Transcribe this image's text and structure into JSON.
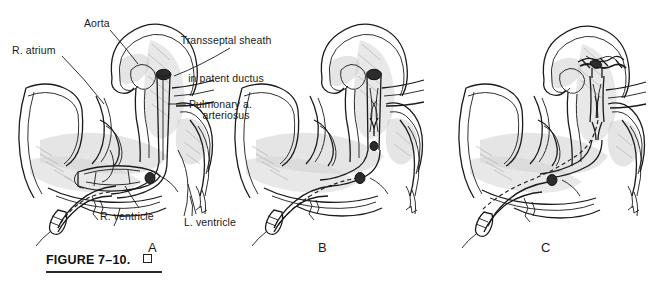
{
  "figure": {
    "caption_text": "FIGURE 7–10.",
    "caption_box_icon": "open-square-icon",
    "panels": [
      {
        "letter": "A",
        "x": 148,
        "y": 240
      },
      {
        "letter": "B",
        "x": 318,
        "y": 240
      },
      {
        "letter": "C",
        "x": 541,
        "y": 240
      }
    ]
  },
  "labels": {
    "r_atrium": "R. atrium",
    "aorta": "Aorta",
    "transseptal_sheath": "Transseptal sheath\nin patent ductus\narteriosus",
    "transseptal_sheath_line1": "Transseptal sheath",
    "transseptal_sheath_line2": "in patent ductus",
    "transseptal_sheath_line3": "arteriosus",
    "pulmonary_a": "Pulmonary a.",
    "r_ventricle": "R. ventricle",
    "l_ventricle": "L. ventricle"
  },
  "colors": {
    "ink": "#1b1b1b",
    "shading": "#d6d6d6",
    "hatch": "#b9b9b9",
    "device_dark": "#2b2b2b",
    "background": "#ffffff"
  },
  "illustration": {
    "subject": "Transcatheter closure of patent ductus arteriosus",
    "view": "line drawing, pen-and-ink, cutaway heart and great vessels",
    "sequence": [
      "A: transseptal sheath advanced across patent ductus arteriosus, guidewire catheter in descending vessel",
      "B: occluder device partially extruded within sheath",
      "C: occluder device fully deployed, sheath withdrawn"
    ]
  }
}
